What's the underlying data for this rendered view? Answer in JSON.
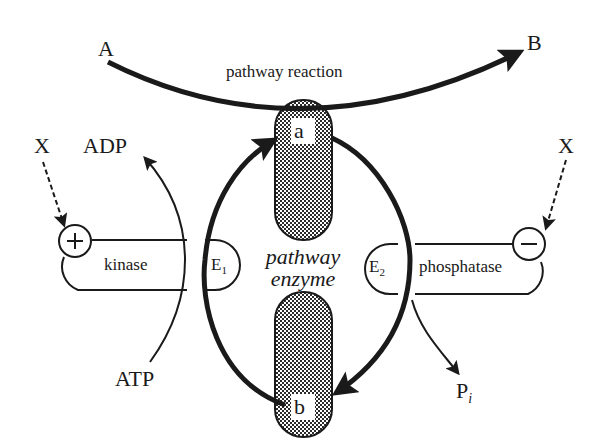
{
  "diagram": {
    "colors": {
      "ink": "#1a1a1a",
      "background": "#ffffff",
      "pattern": "#2a2a2a"
    },
    "substrate": "A",
    "product": "B",
    "pathway_label": "pathway reaction",
    "enzyme_label_line1": "pathway",
    "enzyme_label_line2": "enzyme",
    "form_a": "a",
    "form_b": "b",
    "left": {
      "effector": "X",
      "modulation_sign": "+",
      "enzyme_name": "kinase",
      "enzyme_symbol": "E",
      "enzyme_subscript": "1",
      "product": "ADP",
      "substrate": "ATP"
    },
    "right": {
      "effector": "X",
      "modulation_sign": "−",
      "enzyme_name": "phosphatase",
      "enzyme_symbol": "E",
      "enzyme_subscript": "2",
      "product": "P",
      "product_subscript": "i"
    }
  }
}
